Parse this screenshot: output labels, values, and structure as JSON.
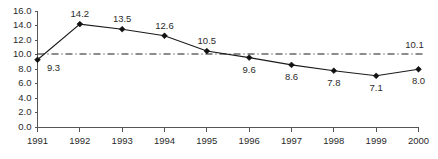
{
  "chart_data": {
    "type": "line",
    "title": "",
    "subtitle": "",
    "xlabel": "",
    "ylabel": "",
    "categories": [
      "1991",
      "1992",
      "1993",
      "1994",
      "1995",
      "1996",
      "1997",
      "1998",
      "1999",
      "2000"
    ],
    "values": [
      9.3,
      14.2,
      13.5,
      12.6,
      10.5,
      9.6,
      8.6,
      7.8,
      7.1,
      8.0
    ],
    "point_labels": [
      "9.3",
      "14.2",
      "13.5",
      "12.6",
      "10.5",
      "9.6",
      "8.6",
      "7.8",
      "7.1",
      "8.0"
    ],
    "label_positions": [
      "below-right",
      "above",
      "above",
      "above",
      "above",
      "below",
      "below",
      "below",
      "below",
      "below"
    ],
    "ylim": [
      0.0,
      16.0
    ],
    "ytick_values": [
      0.0,
      2.0,
      4.0,
      6.0,
      8.0,
      10.0,
      12.0,
      14.0,
      16.0
    ],
    "ytick_labels": [
      "0.0",
      "2.0",
      "4.0",
      "6.0",
      "8.0",
      "10.0",
      "12.0",
      "14.0",
      "16.0"
    ],
    "grid": false,
    "legend": "none",
    "marker": "diamond",
    "line_color": "#1a1a1a",
    "reference_line": {
      "value": 10.1,
      "label": "10.1",
      "style": "dash-dot",
      "color": "#1a1a1a"
    }
  },
  "axes": {
    "x_axis_name": "year-axis",
    "y_axis_name": "value-axis"
  }
}
